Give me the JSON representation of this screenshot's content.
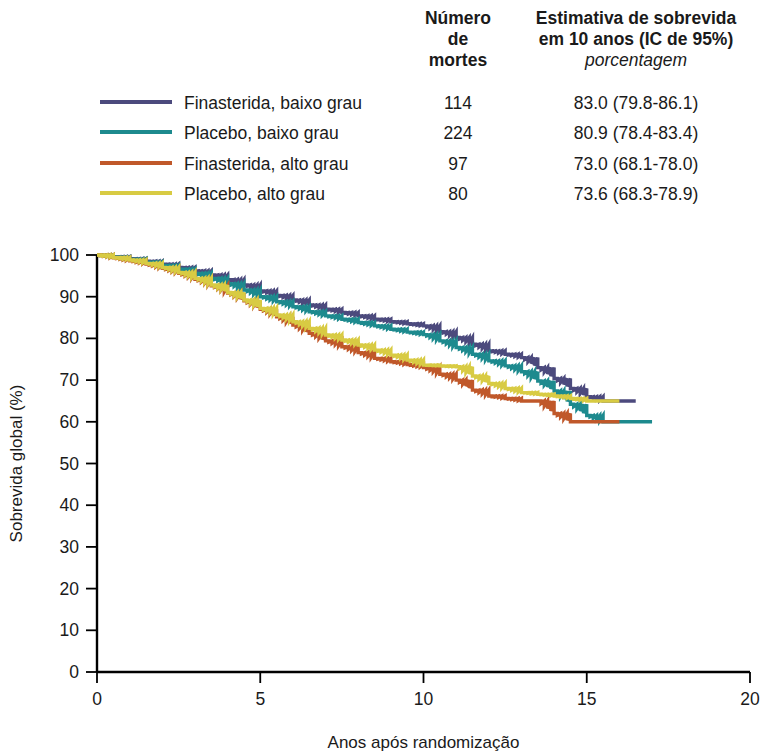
{
  "table": {
    "header_deaths": "Número\nde\nmortes",
    "header_deaths_line1": "Número",
    "header_deaths_line2": "de",
    "header_deaths_line3": "mortes",
    "header_estimate_line1": "Estimativa de sobrevida",
    "header_estimate_line2": "em 10 anos (IC de 95%)",
    "header_estimate_unit": "porcentagem"
  },
  "chart_data": {
    "type": "line",
    "title": "",
    "xlabel": "Anos após randomização",
    "ylabel": "Sobrevida global (%)",
    "xlim": [
      0,
      20
    ],
    "ylim": [
      0,
      100
    ],
    "xticks": [
      0,
      5,
      10,
      15,
      20
    ],
    "xtick_labels": [
      "0",
      "5",
      "10",
      "15",
      "20"
    ],
    "yticks": [
      0,
      10,
      20,
      30,
      40,
      50,
      60,
      70,
      80,
      90,
      100
    ],
    "ytick_labels": [
      "0",
      "10",
      "20",
      "30",
      "40",
      "50",
      "60",
      "70",
      "80",
      "90",
      "100"
    ],
    "grid": false,
    "legend_position": "top",
    "step_style": "post",
    "series": [
      {
        "name": "Finasterida, baixo grau",
        "color": "#4C4A7D",
        "deaths": "114",
        "estimate_10y": "83.0 (79.8-86.1)",
        "x": [
          0,
          0.5,
          1,
          1.5,
          2,
          2.5,
          3,
          3.5,
          4,
          4.5,
          5,
          5.5,
          6,
          6.5,
          7,
          7.5,
          8,
          8.5,
          9,
          9.5,
          10,
          10.5,
          11,
          11.5,
          12,
          12.5,
          13,
          13.5,
          14,
          14.5,
          15,
          15.5,
          16,
          16.5
        ],
        "y": [
          100,
          99.6,
          99.1,
          98.5,
          97.8,
          97.0,
          96.2,
          95.2,
          94.1,
          92.8,
          91.4,
          90.3,
          89.2,
          88.0,
          87.0,
          86.2,
          85.4,
          84.6,
          84.0,
          83.5,
          83.0,
          81.6,
          80.2,
          78.6,
          77.0,
          76.2,
          75.4,
          73.0,
          70.4,
          68.0,
          66.0,
          65.0,
          65.0,
          65.0
        ]
      },
      {
        "name": "Placebo, baixo grau",
        "color": "#1D8A8E",
        "deaths": "224",
        "estimate_10y": "80.9 (78.4-83.4)",
        "x": [
          0,
          0.5,
          1,
          1.5,
          2,
          2.5,
          3,
          3.5,
          4,
          4.5,
          5,
          5.5,
          6,
          6.5,
          7,
          7.5,
          8,
          8.5,
          9,
          9.5,
          10,
          10.5,
          11,
          11.5,
          12,
          12.5,
          13,
          13.5,
          14,
          14.5,
          15,
          15.5,
          16,
          16.5,
          17
        ],
        "y": [
          100,
          99.5,
          99.0,
          98.3,
          97.5,
          96.6,
          95.6,
          94.4,
          93.1,
          91.6,
          90.0,
          88.8,
          87.6,
          86.4,
          85.4,
          84.6,
          83.8,
          83.0,
          82.2,
          81.5,
          80.9,
          79.4,
          77.8,
          76.2,
          74.6,
          73.4,
          72.0,
          69.8,
          67.4,
          64.2,
          61.5,
          60.0,
          60.0,
          60.0,
          60.0
        ]
      },
      {
        "name": "Finasterida, alto grau",
        "color": "#C0582A",
        "deaths": "97",
        "estimate_10y": "73.0 (68.1-78.0)",
        "x": [
          0,
          0.5,
          1,
          1.5,
          2,
          2.5,
          3,
          3.5,
          4,
          4.5,
          5,
          5.5,
          6,
          6.5,
          7,
          7.5,
          8,
          8.5,
          9,
          9.5,
          10,
          10.5,
          11,
          11.5,
          12,
          12.5,
          13,
          13.5,
          14,
          14.5,
          15,
          15.5,
          16
        ],
        "y": [
          100,
          99.3,
          98.6,
          97.8,
          96.8,
          95.6,
          94.2,
          92.6,
          90.9,
          89.0,
          87.0,
          85.2,
          83.2,
          81.2,
          79.4,
          78.0,
          76.6,
          75.2,
          74.4,
          73.7,
          73.0,
          71.4,
          70.0,
          67.6,
          66.2,
          65.6,
          65.0,
          65.0,
          62.0,
          60.0,
          60.0,
          60.0,
          60.0
        ]
      },
      {
        "name": "Placebo, alto grau",
        "color": "#D8CB43",
        "deaths": "80",
        "estimate_10y": "73.6 (68.3-78.9)",
        "x": [
          0,
          0.5,
          1,
          1.5,
          2,
          2.5,
          3,
          3.5,
          4,
          4.5,
          5,
          5.5,
          6,
          6.5,
          7,
          7.5,
          8,
          8.5,
          9,
          9.5,
          10,
          10.5,
          11,
          11.5,
          12,
          12.5,
          13,
          13.5,
          14,
          14.5,
          15,
          15.5,
          16
        ],
        "y": [
          100,
          99.4,
          98.8,
          98.0,
          97.0,
          95.8,
          94.4,
          92.8,
          91.0,
          89.2,
          87.2,
          85.6,
          84.0,
          82.4,
          80.8,
          79.6,
          78.4,
          77.2,
          76.0,
          74.8,
          73.6,
          73.4,
          73.2,
          71.0,
          69.2,
          68.0,
          67.0,
          66.6,
          66.2,
          65.6,
          65.0,
          65.0,
          65.0
        ]
      }
    ]
  }
}
